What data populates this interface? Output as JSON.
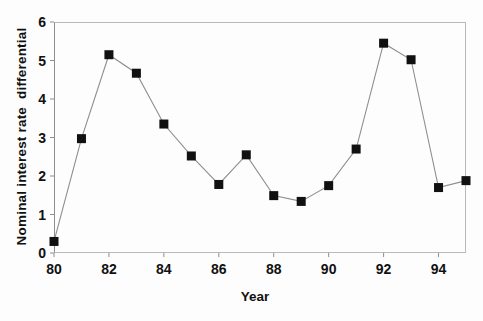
{
  "chart_data": {
    "type": "line",
    "title": "",
    "xlabel": "Year",
    "ylabel": "Nominal interest rate  differential",
    "x": [
      80,
      81,
      82,
      83,
      84,
      85,
      86,
      87,
      88,
      89,
      90,
      91,
      92,
      93,
      94,
      95
    ],
    "values": [
      0.3,
      2.97,
      5.15,
      4.67,
      3.35,
      2.52,
      1.78,
      2.55,
      1.49,
      1.34,
      1.75,
      2.7,
      5.45,
      5.02,
      1.7,
      1.88
    ],
    "series": [
      {
        "name": "Nominal interest rate differential",
        "values": [
          0.3,
          2.97,
          5.15,
          4.67,
          3.35,
          2.52,
          1.78,
          2.55,
          1.49,
          1.34,
          1.75,
          2.7,
          5.45,
          5.02,
          1.7,
          1.88
        ]
      }
    ],
    "xlim": [
      80,
      95
    ],
    "ylim": [
      0,
      6
    ],
    "y_ticks": [
      "0",
      "1",
      "2",
      "3",
      "4",
      "5",
      "6"
    ],
    "x_ticks": [
      "80",
      "82",
      "84",
      "86",
      "88",
      "90",
      "92",
      "94"
    ],
    "x_tick_values": [
      80,
      82,
      84,
      86,
      88,
      90,
      92,
      94
    ],
    "grid": false,
    "legend": null,
    "legend_position": "none",
    "marker": "square",
    "marker_color": "#111111",
    "line_color": "#8f8f8f"
  }
}
